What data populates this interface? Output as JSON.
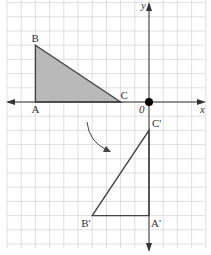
{
  "diagram": {
    "title": "",
    "axes": {
      "x_label": "x",
      "y_label": "y",
      "origin_label": "0"
    },
    "grid": {
      "x_range": [
        -10,
        4
      ],
      "y_range": [
        -10,
        7
      ]
    },
    "colors": {
      "grid": "#d8d8d8",
      "axis": "#333333",
      "shape_fill": "#b9b9b9",
      "shape_stroke": "#444444",
      "origin_dot": "#000000"
    },
    "original_triangle": {
      "vertices": [
        {
          "label": "A",
          "x": -8,
          "y": 0
        },
        {
          "label": "B",
          "x": -8,
          "y": 4
        },
        {
          "label": "C",
          "x": -2,
          "y": 0
        }
      ],
      "shaded": true
    },
    "image_triangle": {
      "vertices": [
        {
          "label": "A'",
          "x": 0,
          "y": -8
        },
        {
          "label": "B'",
          "x": -4,
          "y": -8
        },
        {
          "label": "C'",
          "x": 0,
          "y": -2
        }
      ],
      "shaded": false
    },
    "transformation": "rotation 90° about origin",
    "rotation_arrow": {
      "present": true
    }
  }
}
